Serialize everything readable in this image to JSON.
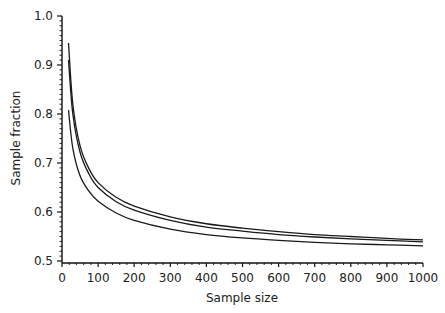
{
  "chart_data": {
    "type": "line",
    "title": "",
    "xlabel": "Sample size",
    "ylabel": "Sample fraction",
    "xlim": [
      0,
      1000
    ],
    "ylim": [
      0.5,
      1.0
    ],
    "xticks": [
      0,
      100,
      200,
      300,
      400,
      500,
      600,
      700,
      800,
      900,
      1000
    ],
    "xtick_labels": [
      "0",
      "100",
      "200",
      "300",
      "400",
      "500",
      "600",
      "700",
      "800",
      "900",
      "1000"
    ],
    "yticks": [
      0.5,
      0.6,
      0.7,
      0.8,
      0.9,
      1.0
    ],
    "ytick_labels": [
      "0.5",
      "0.6",
      "0.7",
      "0.8",
      "0.9",
      "1.0"
    ],
    "grid": false,
    "legend": null,
    "x": [
      18,
      30,
      50,
      75,
      100,
      150,
      200,
      300,
      400,
      500,
      600,
      700,
      800,
      900,
      1000
    ],
    "series": [
      {
        "name": "curve-1 (upper)",
        "values": [
          0.945,
          0.82,
          0.735,
          0.688,
          0.66,
          0.63,
          0.612,
          0.59,
          0.576,
          0.567,
          0.56,
          0.554,
          0.55,
          0.546,
          0.543
        ]
      },
      {
        "name": "curve-2 (middle)",
        "values": [
          0.91,
          0.8,
          0.722,
          0.677,
          0.65,
          0.621,
          0.604,
          0.583,
          0.569,
          0.561,
          0.554,
          0.549,
          0.545,
          0.542,
          0.539
        ]
      },
      {
        "name": "curve-3 (lower)",
        "values": [
          0.808,
          0.73,
          0.674,
          0.642,
          0.622,
          0.598,
          0.583,
          0.565,
          0.554,
          0.547,
          0.542,
          0.538,
          0.535,
          0.533,
          0.531
        ]
      }
    ]
  }
}
